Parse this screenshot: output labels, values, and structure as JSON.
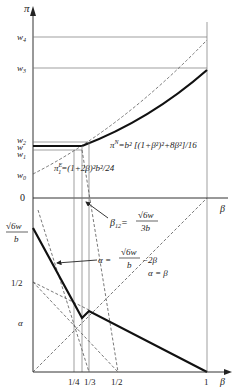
{
  "diagram": {
    "top_panel": {
      "y_axis_label": "π",
      "x_axis_label": "β",
      "y_ticks": [
        "w4",
        "w3",
        "w2",
        "w",
        "w1",
        "w0",
        "0"
      ],
      "curve_labels": {
        "pi_N": "π^N = b² [(1+β²)² + 8β²]/16",
        "pi_N_main": "π",
        "pi_N_sup": "N",
        "pi_N_rest": "=b² [(1+β²)²+8β²]/16",
        "pi_1E_main": "π",
        "pi_1E_sup": "E",
        "pi_1E_sub": "1",
        "pi_1E_rest": "=(1+2β)²b²/24"
      }
    },
    "bottom_panel": {
      "y_axis_label": "α",
      "x_axis_label": "β",
      "y_ticks": [
        "√6w / b",
        "1/2",
        "α"
      ],
      "y_tick_sqrt_num": "√6w",
      "y_tick_sqrt_den": "b",
      "y_tick_half": "1/2",
      "y_tick_alpha": "α",
      "x_ticks": [
        "1/4",
        "1/3",
        "1/2",
        "1"
      ],
      "annotations": {
        "beta12_lhs": "β",
        "beta12_sub": "12",
        "beta12_eq": "=",
        "beta12_num": "√6w",
        "beta12_den": "3b",
        "alpha_line_lhs": "α =",
        "alpha_line_num": "√6w",
        "alpha_line_den": "b",
        "alpha_line_tail": "−2β",
        "alpha_eq_beta": "α = β"
      }
    }
  }
}
